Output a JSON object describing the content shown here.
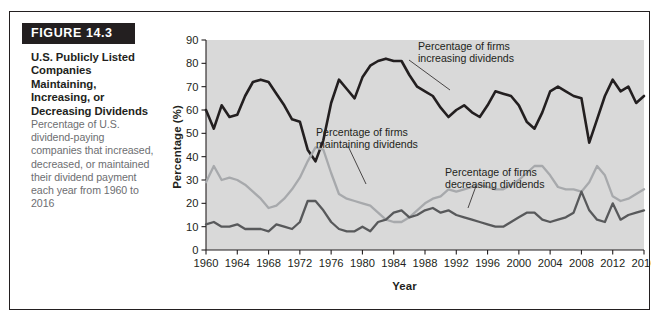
{
  "figure": {
    "tag": "FIGURE 14.3",
    "title": "U.S. Publicly Listed Companies Maintaining, Increasing, or Decreasing Dividends",
    "description": "Percentage of U.S. dividend-paying companies that increased, decreased, or maintained their dividend payment each year from 1960 to 2016"
  },
  "colors": {
    "plot_background": "#d9d9d9",
    "axis": "#231f20",
    "increasing": "#231f20",
    "maintaining": "#a7a9ac",
    "decreasing": "#58595b",
    "card_border": "#231f20",
    "tag_background": "#231f20",
    "tag_text": "#ffffff",
    "description_text": "#6d6e71"
  },
  "annotations": [
    {
      "id": "increasing",
      "line1": "Percentage of firms",
      "line2": "increasing dividends"
    },
    {
      "id": "maintaining",
      "line1": "Percentage of firms",
      "line2": "maintaining dividends"
    },
    {
      "id": "decreasing",
      "line1": "Percentage of firms",
      "line2": "decreasing dividends"
    }
  ],
  "chart_data": {
    "type": "line",
    "title": "U.S. Publicly Listed Companies Maintaining, Increasing, or Decreasing Dividends",
    "xlabel": "Year",
    "ylabel": "Percentage (%)",
    "xlim": [
      1960,
      2016
    ],
    "ylim": [
      0,
      90
    ],
    "yticks": [
      0,
      10,
      20,
      30,
      40,
      50,
      60,
      70,
      80,
      90
    ],
    "xticks": [
      1960,
      1964,
      1968,
      1972,
      1976,
      1980,
      1984,
      1988,
      1992,
      1996,
      2000,
      2004,
      2008,
      2012,
      2016
    ],
    "grid": false,
    "legend": "annotations-inline",
    "x": [
      1960,
      1961,
      1962,
      1963,
      1964,
      1965,
      1966,
      1967,
      1968,
      1969,
      1970,
      1971,
      1972,
      1973,
      1974,
      1975,
      1976,
      1977,
      1978,
      1979,
      1980,
      1981,
      1982,
      1983,
      1984,
      1985,
      1986,
      1987,
      1988,
      1989,
      1990,
      1991,
      1992,
      1993,
      1994,
      1995,
      1996,
      1997,
      1998,
      1999,
      2000,
      2001,
      2002,
      2003,
      2004,
      2005,
      2006,
      2007,
      2008,
      2009,
      2010,
      2011,
      2012,
      2013,
      2014,
      2015,
      2016
    ],
    "series": [
      {
        "name": "Percentage of firms increasing dividends",
        "color": "#231f20",
        "values": [
          60,
          52,
          62,
          57,
          58,
          66,
          72,
          73,
          72,
          67,
          62,
          56,
          55,
          43,
          38,
          47,
          63,
          73,
          69,
          65,
          74,
          79,
          81,
          82,
          81,
          81,
          75,
          70,
          68,
          66,
          61,
          57,
          60,
          62,
          59,
          57,
          62,
          68,
          67,
          66,
          62,
          55,
          52,
          59,
          68,
          70,
          68,
          66,
          65,
          46,
          56,
          66,
          73,
          68,
          70,
          63,
          66
        ]
      },
      {
        "name": "Percentage of firms maintaining dividends",
        "color": "#a7a9ac",
        "values": [
          29,
          36,
          30,
          31,
          30,
          28,
          25,
          22,
          18,
          19,
          22,
          26,
          31,
          38,
          44,
          43,
          33,
          24,
          22,
          21,
          20,
          19,
          16,
          13,
          12,
          12,
          14,
          17,
          20,
          22,
          23,
          26,
          25,
          26,
          27,
          28,
          27,
          26,
          26,
          28,
          30,
          33,
          36,
          36,
          32,
          27,
          26,
          26,
          25,
          29,
          36,
          32,
          23,
          21,
          22,
          24,
          26
        ]
      },
      {
        "name": "Percentage of firms decreasing dividends",
        "color": "#58595b",
        "values": [
          11,
          12,
          10,
          10,
          11,
          9,
          9,
          9,
          8,
          11,
          10,
          9,
          12,
          21,
          21,
          17,
          12,
          9,
          8,
          8,
          10,
          8,
          12,
          13,
          16,
          17,
          14,
          15,
          17,
          18,
          16,
          17,
          15,
          14,
          13,
          12,
          11,
          10,
          10,
          12,
          14,
          16,
          16,
          13,
          12,
          13,
          14,
          16,
          25,
          17,
          13,
          12,
          20,
          13,
          15,
          16,
          17
        ]
      }
    ]
  }
}
